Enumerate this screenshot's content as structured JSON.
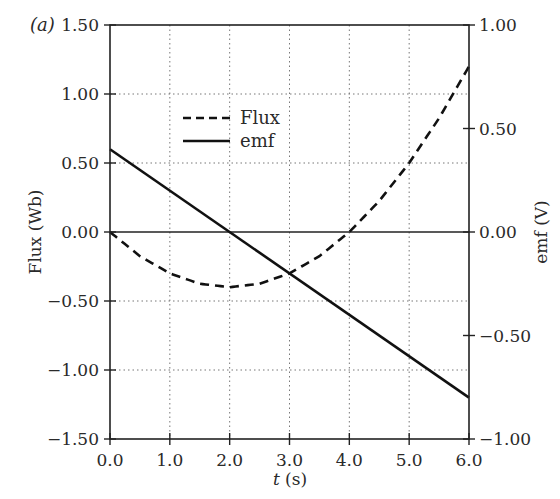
{
  "panel_label": "(a)",
  "chart_data": {
    "type": "line",
    "title": "",
    "xlabel": "t (s)",
    "xlabel_italic_part": "t",
    "xlabel_unit": " (s)",
    "ylabel_left": "Flux (Wb)",
    "ylabel_right": "emf (V)",
    "xlim": [
      0.0,
      6.0
    ],
    "ylim_left": [
      -1.5,
      1.5
    ],
    "ylim_right": [
      -1.0,
      1.0
    ],
    "x_ticks": [
      "0.0",
      "1.0",
      "2.0",
      "3.0",
      "4.0",
      "5.0",
      "6.0"
    ],
    "y_ticks_left": [
      "1.50",
      "1.00",
      "0.50",
      "0.00",
      "−0.50",
      "−1.00",
      "−1.50"
    ],
    "y_ticks_right": [
      "1.00",
      "0.50",
      "0.00",
      "−0.50",
      "−1.00"
    ],
    "grid": true,
    "grid_style": "dotted",
    "legend_position": "upper left (inside)",
    "series": [
      {
        "name": "Flux",
        "axis": "left",
        "style": "dashed",
        "x": [
          0.0,
          0.5,
          1.0,
          1.5,
          2.0,
          2.5,
          3.0,
          3.5,
          4.0,
          4.5,
          5.0,
          5.5,
          6.0
        ],
        "values": [
          0.0,
          -0.175,
          -0.3,
          -0.375,
          -0.4,
          -0.375,
          -0.3,
          -0.175,
          0.0,
          0.225,
          0.5,
          0.825,
          1.2
        ]
      },
      {
        "name": "emf",
        "axis": "right",
        "style": "solid",
        "x": [
          0.0,
          6.0
        ],
        "values": [
          0.4,
          -0.8
        ]
      }
    ]
  },
  "colors": {
    "line": "#111111",
    "axis": "#222222",
    "grid": "#777777"
  }
}
